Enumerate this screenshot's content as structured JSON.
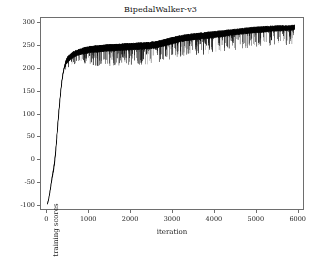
{
  "chart_data": {
    "type": "line",
    "title": "BipedalWalker-v3",
    "xlabel": "iteration",
    "ylabel": "training scores",
    "xlim": [
      -150,
      6150
    ],
    "ylim": [
      -110,
      310
    ],
    "xticks": [
      0,
      1000,
      2000,
      3000,
      4000,
      5000,
      6000
    ],
    "xtick_labels": [
      "0",
      "1000",
      "2000",
      "3000",
      "4000",
      "5000",
      "6000"
    ],
    "yticks": [
      -100,
      -50,
      0,
      50,
      100,
      150,
      200,
      250,
      300
    ],
    "ytick_labels": [
      "-100",
      "-50",
      "0",
      "50",
      "100",
      "150",
      "200",
      "250",
      "300"
    ],
    "grid": false,
    "legend": null,
    "series_color": "#000000",
    "series": [
      {
        "name": "training scores",
        "comment": "Noisy reinforcement-learning reward curve: steep rise from about -100 to ~215 within the first ~500 iterations, then a slowly climbing noisy plateau from ~235 to ~290 by iteration 6000, with frequent downward spikes.",
        "x": [
          0,
          25,
          50,
          75,
          100,
          125,
          150,
          175,
          200,
          225,
          250,
          275,
          300,
          325,
          350,
          375,
          400,
          425,
          450,
          475,
          500,
          600,
          700,
          800,
          900,
          1000,
          1200,
          1400,
          1600,
          1800,
          2000,
          2200,
          2400,
          2600,
          2800,
          3000,
          3200,
          3400,
          3600,
          3800,
          4000,
          4200,
          4400,
          4600,
          4800,
          5000,
          5200,
          5400,
          5600,
          5800,
          5950
        ],
        "mean": [
          -99,
          -92,
          -80,
          -66,
          -50,
          -36,
          -24,
          -8,
          14,
          42,
          72,
          100,
          126,
          150,
          170,
          186,
          198,
          207,
          213,
          217,
          221,
          229,
          234,
          237,
          239,
          241,
          243,
          245,
          246,
          247,
          248,
          249,
          250,
          252,
          256,
          261,
          266,
          269,
          271,
          273,
          275,
          277,
          279,
          281,
          283,
          285,
          286,
          287,
          288,
          289,
          290
        ],
        "band_upper": [
          -96,
          -88,
          -75,
          -60,
          -44,
          -29,
          -16,
          2,
          25,
          52,
          82,
          110,
          135,
          158,
          177,
          192,
          203,
          212,
          218,
          222,
          226,
          234,
          239,
          242,
          245,
          247,
          249,
          251,
          252,
          253,
          254,
          255,
          256,
          258,
          262,
          267,
          271,
          274,
          276,
          278,
          280,
          282,
          284,
          286,
          288,
          290,
          291,
          292,
          293,
          293,
          294
        ],
        "band_lower": [
          -101,
          -96,
          -85,
          -72,
          -57,
          -44,
          -33,
          -18,
          3,
          31,
          61,
          89,
          116,
          141,
          162,
          179,
          191,
          201,
          207,
          211,
          214,
          222,
          227,
          230,
          232,
          234,
          235,
          237,
          238,
          239,
          240,
          241,
          242,
          244,
          248,
          253,
          258,
          261,
          263,
          265,
          267,
          269,
          272,
          274,
          276,
          278,
          279,
          281,
          282,
          283,
          284
        ]
      }
    ],
    "noise": {
      "band_jitter": 5,
      "spike_depth_max": 34,
      "spike_probability": 0.17
    }
  }
}
